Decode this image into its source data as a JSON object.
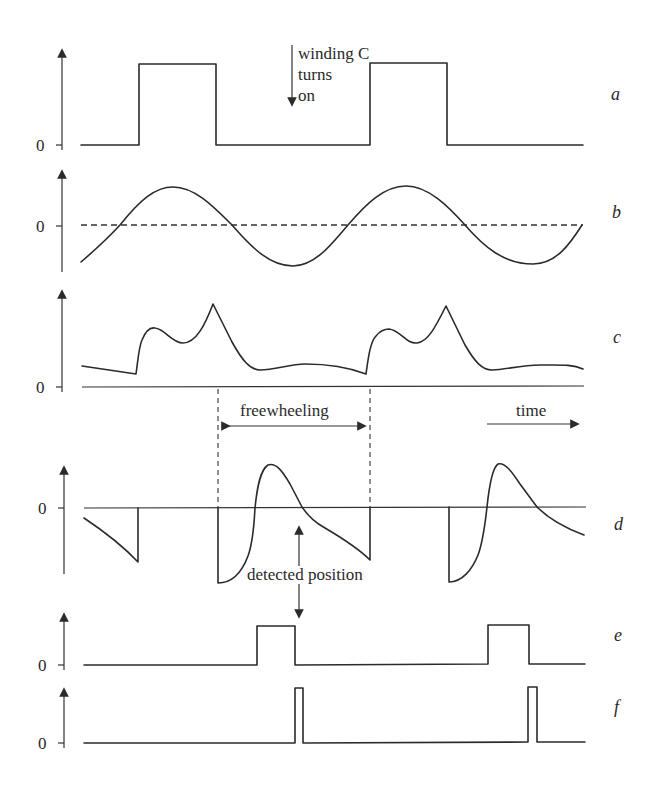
{
  "figure": {
    "colors": {
      "line": "#2b2b2b",
      "background": "#ffffff"
    },
    "annotations": {
      "winding_line1": "winding C",
      "winding_line2": "turns",
      "winding_line3": "on",
      "freewheeling": "freewheeling",
      "time": "time",
      "detected_position": "detected position"
    },
    "panels": [
      {
        "id": "a",
        "label": "a",
        "zero_label": "0",
        "description": "phase winding voltage / conduction pulses"
      },
      {
        "id": "b",
        "label": "b",
        "zero_label": "0",
        "description": "sinusoidal back-EMF"
      },
      {
        "id": "c",
        "label": "c",
        "zero_label": "0",
        "description": "phase current"
      },
      {
        "id": "d",
        "label": "d",
        "zero_label": "0",
        "description": "terminal voltage during freewheeling"
      },
      {
        "id": "e",
        "label": "e",
        "zero_label": "0",
        "description": "detection window"
      },
      {
        "id": "f",
        "label": "f",
        "zero_label": "0",
        "description": "position pulse"
      }
    ]
  }
}
